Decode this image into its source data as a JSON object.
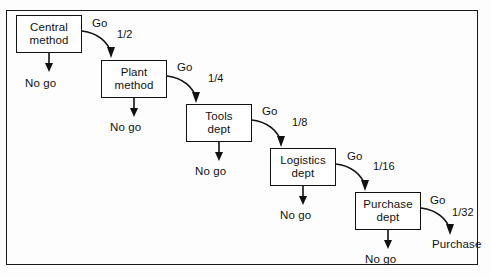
{
  "diagram": {
    "frame": {
      "border_color": "#1a1a1a"
    },
    "nodes": [
      {
        "id": "central-method",
        "line1": "Central",
        "line2": "method",
        "x": 16,
        "y": 15,
        "w": 66,
        "h": 38
      },
      {
        "id": "plant-method",
        "line1": "Plant",
        "line2": "method",
        "x": 101,
        "y": 60,
        "w": 66,
        "h": 38
      },
      {
        "id": "tools-dept",
        "line1": "Tools",
        "line2": "dept",
        "x": 186,
        "y": 104,
        "w": 66,
        "h": 38
      },
      {
        "id": "logistics-dept",
        "line1": "Logistics",
        "line2": "dept",
        "x": 270,
        "y": 148,
        "w": 66,
        "h": 38
      },
      {
        "id": "purchase-dept",
        "line1": "Purchase",
        "line2": "dept",
        "x": 355,
        "y": 192,
        "w": 66,
        "h": 38
      }
    ],
    "go_labels": [
      {
        "id": "go-1",
        "text": "Go",
        "x": 92,
        "y": 17
      },
      {
        "id": "go-2",
        "text": "Go",
        "x": 177,
        "y": 61
      },
      {
        "id": "go-3",
        "text": "Go",
        "x": 262,
        "y": 105
      },
      {
        "id": "go-4",
        "text": "Go",
        "x": 347,
        "y": 150
      },
      {
        "id": "go-5",
        "text": "Go",
        "x": 430,
        "y": 194
      }
    ],
    "fraction_labels": [
      {
        "id": "frac-1",
        "text": "1/2",
        "x": 117,
        "y": 28
      },
      {
        "id": "frac-2",
        "text": "1/4",
        "x": 208,
        "y": 72
      },
      {
        "id": "frac-3",
        "text": "1/8",
        "x": 292,
        "y": 116
      },
      {
        "id": "frac-4",
        "text": "1/16",
        "x": 373,
        "y": 160
      },
      {
        "id": "frac-5",
        "text": "1/32",
        "x": 452,
        "y": 206
      }
    ],
    "nogo_labels": [
      {
        "id": "nogo-1",
        "text": "No go",
        "x": 25,
        "y": 77
      },
      {
        "id": "nogo-2",
        "text": "No go",
        "x": 110,
        "y": 121
      },
      {
        "id": "nogo-3",
        "text": "No go",
        "x": 195,
        "y": 165
      },
      {
        "id": "nogo-4",
        "text": "No go",
        "x": 280,
        "y": 209
      },
      {
        "id": "nogo-5",
        "text": "No go",
        "x": 365,
        "y": 253
      }
    ],
    "terminal_label": {
      "id": "purchase-outcome",
      "text": "Purchase",
      "x": 432,
      "y": 238
    },
    "nogo_arrows": [
      {
        "id": "nogo-arrow-1",
        "x": 49,
        "y1": 53,
        "y2": 70
      },
      {
        "id": "nogo-arrow-2",
        "x": 134,
        "y1": 98,
        "y2": 115
      },
      {
        "id": "nogo-arrow-3",
        "x": 219,
        "y1": 142,
        "y2": 159
      },
      {
        "id": "nogo-arrow-4",
        "x": 303,
        "y1": 186,
        "y2": 203
      },
      {
        "id": "nogo-arrow-5",
        "x": 388,
        "y1": 230,
        "y2": 247
      }
    ],
    "go_arrows": [
      {
        "id": "go-arrow-1",
        "d": "M 82 31 C 98 33, 108 42, 111 53"
      },
      {
        "id": "go-arrow-2",
        "d": "M 167 76 C 183 78, 193 87, 196 98"
      },
      {
        "id": "go-arrow-3",
        "d": "M 252 120 C 268 122, 278 131, 281 142"
      },
      {
        "id": "go-arrow-4",
        "d": "M 336 164 C 352 166, 362 175, 365 186"
      },
      {
        "id": "go-arrow-5",
        "d": "M 421 208 C 437 210, 447 219, 450 230"
      }
    ],
    "go_arrowheads": [
      {
        "id": "go-head-1",
        "points": "111,58 107,47 115,47"
      },
      {
        "id": "go-head-2",
        "points": "196,103 192,92 200,92"
      },
      {
        "id": "go-head-3",
        "points": "281,147 277,136 285,136"
      },
      {
        "id": "go-head-4",
        "points": "365,191 361,180 369,180"
      },
      {
        "id": "go-head-5",
        "points": "450,235 446,224 454,224"
      }
    ]
  }
}
